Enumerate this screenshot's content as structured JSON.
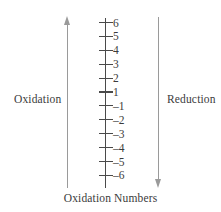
{
  "figure": {
    "caption": "Oxidation Numbers",
    "left_label": "Oxidation",
    "right_label": "Reduction",
    "colors": {
      "arrow": "#9a9a9a",
      "axis": "#4a4a4a",
      "text": "#3b3b3b",
      "background": "#ffffff"
    }
  },
  "chart_data": {
    "type": "scatter",
    "title": "Oxidation Numbers",
    "xlabel": "",
    "ylabel": "Oxidation Numbers",
    "orientation": "vertical",
    "grid": false,
    "legend": false,
    "axis_direction": "descending",
    "tick_labels": [
      "6",
      "5",
      "4",
      "3",
      "2",
      "1",
      "–1",
      "–2",
      "–3",
      "–4",
      "–5",
      "–6"
    ],
    "tick_values": [
      6,
      5,
      4,
      3,
      2,
      1,
      -1,
      -2,
      -3,
      -4,
      -5,
      -6
    ],
    "ylim": [
      -6,
      6
    ],
    "zero_shown": false,
    "annotations": [
      {
        "text": "Oxidation",
        "position": "left",
        "arrow_direction": "up",
        "meaning": "increasing oxidation number"
      },
      {
        "text": "Reduction",
        "position": "right",
        "arrow_direction": "down",
        "meaning": "decreasing oxidation number"
      }
    ]
  }
}
